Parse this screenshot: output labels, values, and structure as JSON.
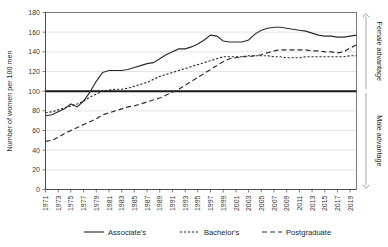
{
  "chart_data": {
    "type": "line",
    "title": "",
    "xlabel": "",
    "ylabel": "Number of women per 100 men",
    "ylim": [
      0,
      180
    ],
    "xlim": [
      1971,
      2020
    ],
    "ytick_step": 20,
    "yticks": [
      0,
      20,
      40,
      60,
      80,
      100,
      120,
      140,
      160,
      180
    ],
    "xticks": [
      1971,
      1973,
      1975,
      1977,
      1979,
      1981,
      1983,
      1985,
      1987,
      1989,
      1991,
      1993,
      1995,
      1997,
      1999,
      2001,
      2003,
      2005,
      2007,
      2009,
      2011,
      2013,
      2015,
      2017,
      2019
    ],
    "grid": "horizontal",
    "legend_position": "bottom",
    "reference_line": {
      "value": 100,
      "label": "parity"
    },
    "annotations": [
      {
        "text": "Female advantage",
        "region": "above-100",
        "side": "right"
      },
      {
        "text": "Male advantage",
        "region": "below-100",
        "side": "right"
      }
    ],
    "x": [
      1971,
      1972,
      1973,
      1974,
      1975,
      1976,
      1977,
      1978,
      1979,
      1980,
      1981,
      1982,
      1983,
      1984,
      1985,
      1986,
      1987,
      1988,
      1989,
      1990,
      1991,
      1992,
      1993,
      1994,
      1995,
      1996,
      1997,
      1998,
      1999,
      2000,
      2001,
      2002,
      2003,
      2004,
      2005,
      2006,
      2007,
      2008,
      2009,
      2010,
      2011,
      2012,
      2013,
      2014,
      2015,
      2016,
      2017,
      2018,
      2019,
      2020
    ],
    "series": [
      {
        "name": "Associate's",
        "style": "solid",
        "values": [
          75,
          76,
          79,
          82,
          87,
          84,
          90,
          99,
          110,
          119,
          121,
          121,
          121,
          122,
          124,
          126,
          128,
          129,
          133,
          137,
          140,
          143,
          143,
          145,
          148,
          152,
          157,
          156,
          151,
          150,
          150,
          150,
          152,
          158,
          162,
          164,
          165,
          165,
          164,
          163,
          162,
          161,
          159,
          157,
          156,
          156,
          155,
          155,
          156,
          157
        ]
      },
      {
        "name": "Bachelor's",
        "style": "dotted",
        "values": [
          78,
          79,
          81,
          83,
          85,
          87,
          90,
          94,
          97,
          100,
          101,
          102,
          102,
          103,
          105,
          107,
          109,
          112,
          115,
          117,
          119,
          121,
          123,
          125,
          127,
          129,
          131,
          133,
          135,
          135,
          135,
          135,
          136,
          136,
          136,
          136,
          135,
          135,
          134,
          134,
          134,
          135,
          135,
          135,
          135,
          135,
          135,
          135,
          136,
          136
        ]
      },
      {
        "name": "Postgraduate",
        "style": "dashed",
        "values": [
          49,
          50,
          53,
          57,
          60,
          63,
          66,
          69,
          72,
          76,
          78,
          80,
          82,
          84,
          85,
          87,
          89,
          91,
          93,
          96,
          99,
          102,
          106,
          110,
          114,
          118,
          122,
          126,
          130,
          133,
          134,
          135,
          135,
          136,
          137,
          139,
          141,
          142,
          142,
          142,
          142,
          142,
          141,
          141,
          140,
          140,
          139,
          140,
          144,
          147
        ]
      }
    ]
  },
  "axis": {
    "y_title": "Number of women per 100 men"
  },
  "side_annotations": {
    "female": "Female advantage",
    "male": "Male advantage"
  },
  "legend": {
    "items": [
      {
        "label": "Associate's",
        "style": "solid"
      },
      {
        "label": "Bachelor's",
        "style": "dotted"
      },
      {
        "label": "Postgraduate",
        "style": "dashed"
      }
    ]
  }
}
